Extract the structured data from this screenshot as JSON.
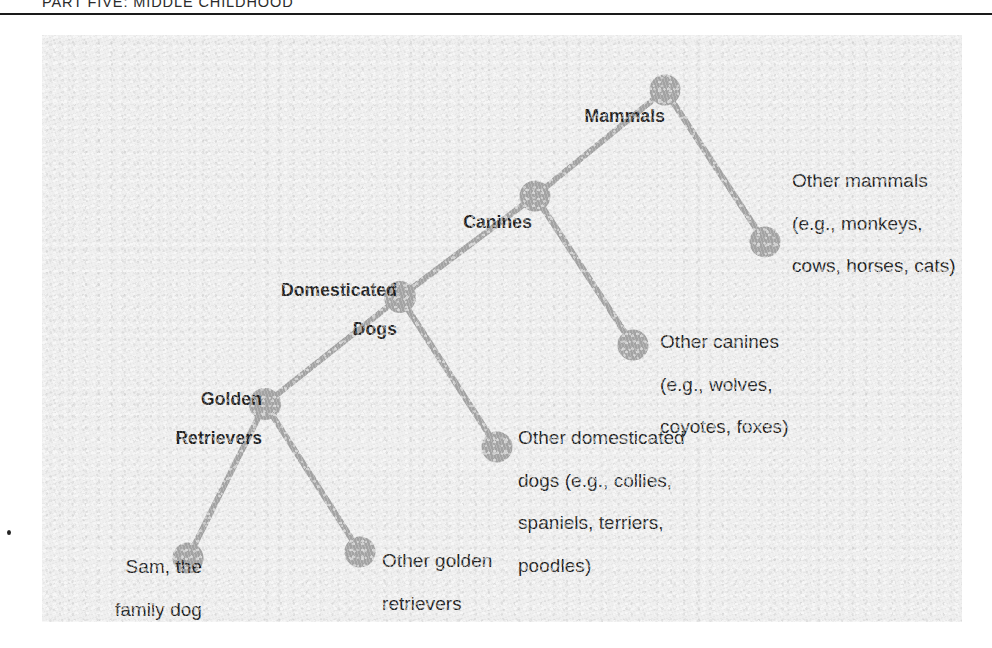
{
  "page": {
    "running_head": "PART FIVE: MIDDLE CHILDHOOD"
  },
  "figure": {
    "panel_background": "#eeeeee",
    "node_color": "#a3a3a3",
    "link_color": "#a3a3a3",
    "text_color": "#1c1c1c"
  },
  "chart_data": {
    "type": "diagram",
    "subtype": "hierarchical-tree",
    "title": "PART FIVE: MIDDLE CHILDHOOD",
    "nodes": [
      {
        "id": "mammals",
        "label": "Mammals",
        "x": 665,
        "y": 90,
        "r": 15.5,
        "label_x": 0,
        "label_y": 0,
        "bold": true,
        "align": "right"
      },
      {
        "id": "other_mammals",
        "label": "Other mammals\n(e.g., monkeys,\ncows, horses, cats)",
        "x": 765,
        "y": 242,
        "r": 15.5,
        "label_x": 0,
        "label_y": 0,
        "bold": false,
        "align": "left"
      },
      {
        "id": "canines",
        "label": "Canines",
        "x": 535,
        "y": 196,
        "r": 15.5,
        "label_x": 0,
        "label_y": 0,
        "bold": true,
        "align": "right"
      },
      {
        "id": "other_canines",
        "label": "Other canines\n(e.g., wolves,\ncoyotes, foxes)",
        "x": 633,
        "y": 345,
        "r": 15.5,
        "label_x": 0,
        "label_y": 0,
        "bold": false,
        "align": "left"
      },
      {
        "id": "dom_dogs",
        "label": "Domesticated\nDogs",
        "x": 400,
        "y": 297,
        "r": 16.0,
        "label_x": 0,
        "label_y": 0,
        "bold": true,
        "align": "right"
      },
      {
        "id": "other_dom",
        "label": "Other domesticated\ndogs (e.g., collies,\nspaniels, terriers,\npoodles)",
        "x": 497,
        "y": 447,
        "r": 15.5,
        "label_x": 0,
        "label_y": 0,
        "bold": false,
        "align": "left"
      },
      {
        "id": "golden",
        "label": "Golden\nRetrievers",
        "x": 265,
        "y": 404,
        "r": 16.0,
        "label_x": 0,
        "label_y": 0,
        "bold": true,
        "align": "right"
      },
      {
        "id": "sam",
        "label": "Sam, the\nfamily dog",
        "x": 188,
        "y": 558,
        "r": 15.5,
        "label_x": 0,
        "label_y": 0,
        "bold": false,
        "align": "right"
      },
      {
        "id": "other_golden",
        "label": "Other golden\nretrievers",
        "x": 360,
        "y": 552,
        "r": 15.5,
        "label_x": 0,
        "label_y": 0,
        "bold": false,
        "align": "left"
      }
    ],
    "edges": [
      {
        "from": "mammals",
        "to": "other_mammals"
      },
      {
        "from": "mammals",
        "to": "canines"
      },
      {
        "from": "canines",
        "to": "other_canines"
      },
      {
        "from": "canines",
        "to": "dom_dogs"
      },
      {
        "from": "dom_dogs",
        "to": "other_dom"
      },
      {
        "from": "dom_dogs",
        "to": "golden"
      },
      {
        "from": "golden",
        "to": "sam"
      },
      {
        "from": "golden",
        "to": "other_golden"
      }
    ],
    "labels": {
      "mammals": "Mammals",
      "other_mammals_l1": "Other mammals",
      "other_mammals_l2": "(e.g., monkeys,",
      "other_mammals_l3": "cows, horses, cats)",
      "canines": "Canines",
      "other_canines_l1": "Other canines",
      "other_canines_l2": "(e.g., wolves,",
      "other_canines_l3": "coyotes, foxes)",
      "dom_dogs_l1": "Domesticated",
      "dom_dogs_l2": "Dogs",
      "other_dom_l1": "Other domesticated",
      "other_dom_l2": "dogs (e.g., collies,",
      "other_dom_l3": "spaniels, terriers,",
      "other_dom_l4": "poodles)",
      "golden_l1": "Golden",
      "golden_l2": "Retrievers",
      "sam_l1": "Sam, the",
      "sam_l2": "family dog",
      "other_golden_l1": "Other golden",
      "other_golden_l2": "retrievers"
    }
  }
}
